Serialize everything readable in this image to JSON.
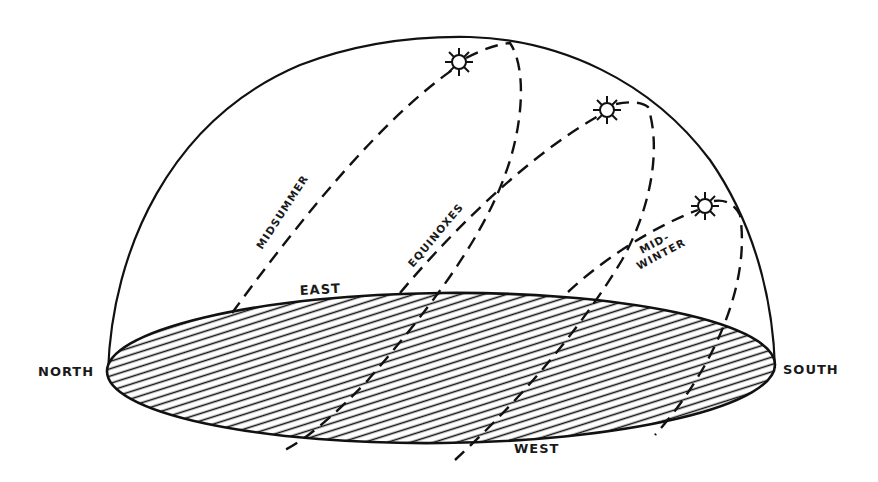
{
  "diagram": {
    "compass": {
      "north": "NORTH",
      "south": "SOUTH",
      "east": "EAST",
      "west": "WEST"
    },
    "sun_paths": [
      {
        "id": "midsummer",
        "label": "MIDSUMMER",
        "label_lines": [
          "MIDSUMMER"
        ]
      },
      {
        "id": "equinoxes",
        "label": "EQUINOXES",
        "label_lines": [
          "EQUINOXES"
        ]
      },
      {
        "id": "midwinter",
        "label": "MID-WINTER",
        "label_lines": [
          "MID-",
          "WINTER"
        ]
      }
    ],
    "icons": {
      "sun": "sun-icon"
    },
    "colors": {
      "ink": "#111111",
      "background": "#ffffff"
    }
  }
}
